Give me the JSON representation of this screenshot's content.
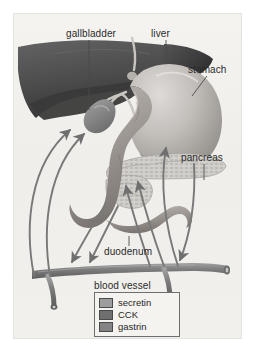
{
  "figure": {
    "background_color": "#f2f1ee",
    "frame_color": "#e3e2df"
  },
  "labels": {
    "gallbladder": "gallbladder",
    "liver": "liver",
    "stomach": "stomach",
    "pancreas": "pancreas",
    "duodenum": "duodenum",
    "blood_vessel": "blood vessel"
  },
  "organs": [
    {
      "name": "liver",
      "color": "#5a5a5a",
      "shade_dark": "#3c3c3c",
      "shade_light": "#6e6e6e"
    },
    {
      "name": "gallbladder",
      "color": "#8d8d8d",
      "shade_dark": "#6b6b6b"
    },
    {
      "name": "stomach",
      "color": "#b9b5b2",
      "shade_dark": "#8e8a86",
      "shade_light": "#d8d5d2"
    },
    {
      "name": "pancreas",
      "color": "#cfcdc8",
      "shade_dark": "#a9a6a1"
    },
    {
      "name": "duodenum",
      "color": "#a8a29d",
      "shade_dark": "#807a75"
    },
    {
      "name": "blood-vessel",
      "color": "#8a8a8a",
      "shade_dark": "#666666"
    }
  ],
  "legend": {
    "border_color": "#6e6e6e",
    "items": [
      {
        "label": "secretin",
        "color": "#9d9d9d"
      },
      {
        "label": "CCK",
        "color": "#6f6f6f"
      },
      {
        "label": "gastrin",
        "color": "#848484"
      }
    ]
  },
  "arrows": {
    "stroke_color": "#7b7b7b",
    "groups": [
      {
        "hormone": "secretin",
        "from": "duodenum",
        "to": "gallbladder",
        "direction": "up-left"
      },
      {
        "hormone": "CCK",
        "from": "duodenum",
        "to": "gallbladder",
        "direction": "up-left"
      },
      {
        "hormone": "secretin",
        "from": "duodenum",
        "to": "blood vessel",
        "direction": "down-left"
      },
      {
        "hormone": "CCK",
        "from": "duodenum",
        "to": "blood vessel",
        "direction": "down-left"
      },
      {
        "hormone": "gastrin",
        "from": "blood vessel",
        "to": "stomach",
        "direction": "up-right"
      },
      {
        "hormone": "secretin",
        "from": "blood vessel",
        "to": "pancreas",
        "direction": "up-right"
      },
      {
        "hormone": "CCK",
        "from": "blood vessel",
        "to": "pancreas",
        "direction": "up-right"
      },
      {
        "hormone": "gastrin",
        "from": "stomach",
        "to": "blood vessel",
        "direction": "down-right"
      }
    ]
  }
}
